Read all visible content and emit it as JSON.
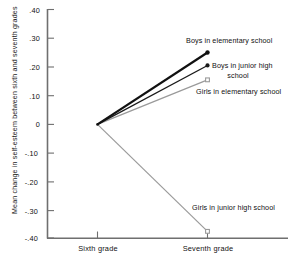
{
  "chart_data": {
    "type": "line",
    "title": "",
    "xlabel": "",
    "ylabel": "Mean change in self-esteem between sixth and seventh grades",
    "categories": [
      "Sixth grade",
      "Seventh grade"
    ],
    "ylim": [
      -0.4,
      0.4
    ],
    "yticks": [
      ".40",
      ".30",
      ".20",
      ".10",
      "0",
      "-.10",
      "-.20",
      "-.30",
      "-.40"
    ],
    "ytick_values": [
      0.4,
      0.3,
      0.2,
      0.1,
      0,
      -0.1,
      -0.2,
      -0.3,
      -0.4
    ],
    "grid": false,
    "legend_position": "inline-right",
    "series": [
      {
        "name": "Boys in elementary school",
        "label_line1": "Boys in elementary school",
        "label_line2": "",
        "values": [
          0,
          0.25
        ],
        "color": "#111111",
        "width": 2.2,
        "marker": "filled-circle"
      },
      {
        "name": "Boys in junior high school",
        "label_line1": "Boys in junior high",
        "label_line2": "school",
        "values": [
          0,
          0.205
        ],
        "color": "#1a1a1a",
        "width": 1.3,
        "marker": "filled-circle"
      },
      {
        "name": "Girls in elementary school",
        "label_line1": "Girls in elementary school",
        "label_line2": "",
        "values": [
          0,
          0.155
        ],
        "color": "#9a9a9a",
        "width": 1.2,
        "marker": "open-square"
      },
      {
        "name": "Girls in junior high school",
        "label_line1": "Girls in junior high school",
        "label_line2": "",
        "values": [
          0,
          -0.372
        ],
        "color": "#9a9a9a",
        "width": 1.2,
        "marker": "open-square"
      }
    ]
  },
  "axis": {
    "y_title": "Mean change in self-esteem between sixth and seventh grades",
    "tick_040": ".40",
    "tick_030": ".30",
    "tick_020": ".20",
    "tick_010": ".10",
    "tick_0": "0",
    "tick_n010": "-.10",
    "tick_n020": "-.20",
    "tick_n030": "-.30",
    "tick_n040": "-.40",
    "x_sixth": "Sixth grade",
    "x_seventh": "Seventh grade"
  },
  "labels": {
    "boys_elementary": "Boys in elementary school",
    "boys_junior_l1": "Boys in junior high",
    "boys_junior_l2": "school",
    "girls_elementary": "Girls in elementary school",
    "girls_junior": "Girls in junior high school"
  },
  "colors": {
    "axis": "#6f6f6f",
    "dark_series": "#111111",
    "gray_series": "#9a9a9a",
    "text": "#111111",
    "background": "#ffffff"
  }
}
